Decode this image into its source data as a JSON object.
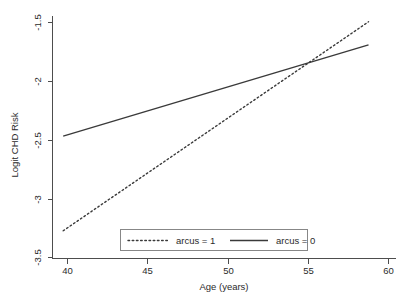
{
  "chart_data": {
    "type": "line",
    "title": "",
    "xlabel": "Age (years)",
    "ylabel": "Logit CHD Risk",
    "xlim": [
      38.3,
      60.8
    ],
    "ylim": [
      -3.55,
      -1.45
    ],
    "grid": false,
    "legend_position": "bottom-center",
    "x_ticks": [
      40,
      45,
      50,
      55,
      60
    ],
    "x_tick_labels": [
      "40",
      "45",
      "50",
      "55",
      "60"
    ],
    "y_ticks": [
      -1.5,
      -2,
      -2.5,
      -3,
      -3.5
    ],
    "y_tick_labels": [
      "-1.5",
      "-2",
      "-2.5",
      "-3",
      "-3.5"
    ],
    "series": [
      {
        "name": "arcus = 1",
        "style": "dotted",
        "color": "#3a3a3a",
        "x": [
          39,
          59
        ],
        "values": [
          -3.31,
          -1.5
        ]
      },
      {
        "name": "arcus = 0",
        "style": "solid",
        "color": "#3a3a3a",
        "x": [
          39,
          59
        ],
        "values": [
          -2.49,
          -1.7
        ]
      }
    ],
    "legend": [
      {
        "label": "arcus = 1",
        "style": "dotted"
      },
      {
        "label": "arcus = 0",
        "style": "solid"
      }
    ]
  }
}
